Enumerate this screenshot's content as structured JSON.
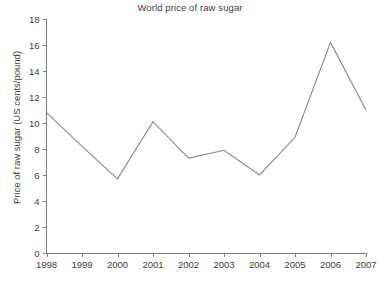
{
  "chart_data": {
    "type": "line",
    "title": "World price of raw sugar",
    "xlabel": "",
    "ylabel": "Price of raw sugar (US cents/pound)",
    "categories": [
      "1998",
      "1999",
      "2000",
      "2001",
      "2002",
      "2003",
      "2004",
      "2005",
      "2006",
      "2007"
    ],
    "x": [
      1998,
      1999,
      2000,
      2001,
      2002,
      2003,
      2004,
      2005,
      2006,
      2007
    ],
    "values": [
      10.8,
      8.2,
      5.7,
      10.1,
      7.3,
      7.9,
      6.0,
      8.9,
      16.2,
      11.0
    ],
    "series": [
      {
        "name": "World price of raw sugar",
        "values": [
          10.8,
          8.2,
          5.7,
          10.1,
          7.3,
          7.9,
          6.0,
          8.9,
          16.2,
          11.0
        ]
      }
    ],
    "ylim": [
      0,
      18
    ],
    "yticks": [
      0,
      2,
      4,
      6,
      8,
      10,
      12,
      14,
      16,
      18
    ],
    "ytick_labels": [
      "0",
      "2",
      "4",
      "6",
      "8",
      "10",
      "12",
      "14",
      "16",
      "18"
    ],
    "xtick_labels": [
      "1998",
      "1999",
      "2000",
      "2001",
      "2002",
      "2003",
      "2004",
      "2005",
      "2006",
      "2007"
    ],
    "grid": false,
    "legend": "none",
    "line_color": "#8a8a8a",
    "axis_color": "#7d7d7d",
    "text_color": "#3d3d3d"
  },
  "caption": {
    "text": "",
    "note": "cut off at image edge"
  }
}
